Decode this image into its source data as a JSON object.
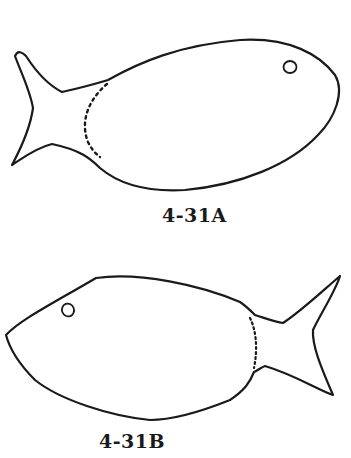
{
  "figures": [
    {
      "label": "4-31A",
      "subject": "fish outline",
      "orientation": "facing right, tail on left",
      "features": [
        "eye-circle",
        "dotted-line-at-tail-junction"
      ]
    },
    {
      "label": "4-31B",
      "subject": "fish outline",
      "orientation": "facing left, tail on right",
      "features": [
        "eye-circle",
        "dotted-line-at-tail-junction"
      ]
    }
  ],
  "colors": {
    "stroke": "#1a1a1a",
    "background": "#ffffff"
  }
}
